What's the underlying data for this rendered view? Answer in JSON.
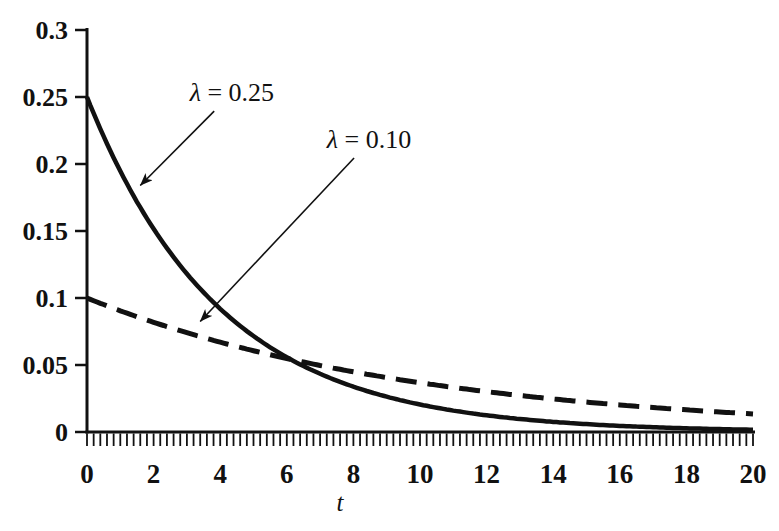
{
  "chart_data": {
    "type": "line",
    "title": "",
    "xlabel": "t",
    "ylabel": "",
    "xlim": [
      0,
      20
    ],
    "ylim": [
      0,
      0.3
    ],
    "grid": false,
    "legend": "none",
    "x_major_ticks": [
      0,
      2,
      4,
      6,
      8,
      10,
      12,
      14,
      16,
      18,
      20
    ],
    "x_minor_tick_step": 0.2,
    "y_ticks": [
      0,
      0.05,
      0.1,
      0.15,
      0.2,
      0.25,
      0.3
    ],
    "y_tick_labels": [
      "0",
      "0.05",
      "0.1",
      "0.15",
      "0.2",
      "0.25",
      "0.3"
    ],
    "x_sample": [
      0,
      1,
      2,
      3,
      4,
      5,
      6,
      7,
      8,
      9,
      10,
      11,
      12,
      13,
      14,
      15,
      16,
      17,
      18,
      19,
      20
    ],
    "series": [
      {
        "id": "lambda-025",
        "name": "lambda = 0.25",
        "lambda": 0.25,
        "style": "solid",
        "values": [
          0.25,
          0.1947,
          0.1516,
          0.1181,
          0.092,
          0.0716,
          0.0558,
          0.0434,
          0.0338,
          0.0263,
          0.0205,
          0.016,
          0.0124,
          0.0097,
          0.0076,
          0.0059,
          0.0046,
          0.0036,
          0.0028,
          0.0022,
          0.0017
        ]
      },
      {
        "id": "lambda-010",
        "name": "lambda = 0.10",
        "lambda": 0.1,
        "style": "dashed",
        "values": [
          0.1,
          0.0905,
          0.0819,
          0.0741,
          0.067,
          0.0607,
          0.0549,
          0.0497,
          0.0449,
          0.0407,
          0.0368,
          0.0333,
          0.0301,
          0.0273,
          0.0247,
          0.0223,
          0.0202,
          0.0183,
          0.0165,
          0.015,
          0.0135
        ]
      }
    ],
    "annotations": [
      {
        "text": "λ = 0.25",
        "symbol": "λ",
        "rest": " = 0.25",
        "text_pos": [
          4.35,
          0.253
        ],
        "arrow_start": [
          3.82,
          0.2395
        ],
        "arrow_end": [
          1.6,
          0.184
        ]
      },
      {
        "text": "λ = 0.10",
        "symbol": "λ",
        "rest": " = 0.10",
        "text_pos": [
          8.47,
          0.218
        ],
        "arrow_start": [
          8.02,
          0.2045
        ],
        "arrow_end": [
          3.4,
          0.0825
        ]
      }
    ]
  }
}
